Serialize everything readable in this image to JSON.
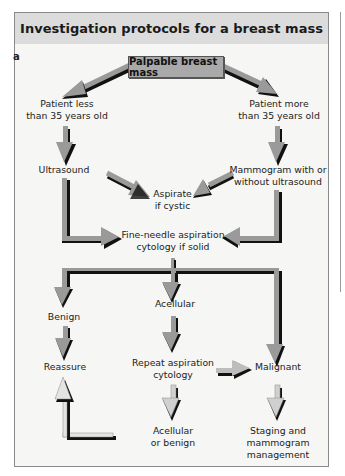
{
  "title": "Investigation protocols for a breast mass",
  "panel_label": "a",
  "nodes": {
    "root": "Palpable breast mass",
    "young_line1": "Patient less",
    "young_line2": "than 35 years old",
    "old_line1": "Patient more",
    "old_line2": "than 35 years old",
    "ultrasound": "Ultrasound",
    "mammogram_line1": "Mammogram with or",
    "mammogram_line2": "without ultrasound",
    "aspirate_line1": "Aspirate",
    "aspirate_line2": "if cystic",
    "fna_line1": "Fine-needle aspiration",
    "fna_line2": "cytology if solid",
    "benign": "Benign",
    "acellular": "Acellular",
    "reassure": "Reassure",
    "repeat_line1": "Repeat aspiration",
    "repeat_line2": "cytology",
    "malignant": "Malignant",
    "acellular_benign_line1": "Acellular",
    "acellular_benign_line2": "or benign",
    "staging_line1": "Staging and",
    "staging_line2": "mammogram",
    "staging_line3": "management"
  },
  "colors": {
    "arrow_fill": "#9a9a9a",
    "arrow_shadow": "#111111",
    "header_bg": "#dcdcdc",
    "root_box_bg": "#a9a9a9",
    "panel_bg": "#f6f6f4"
  }
}
